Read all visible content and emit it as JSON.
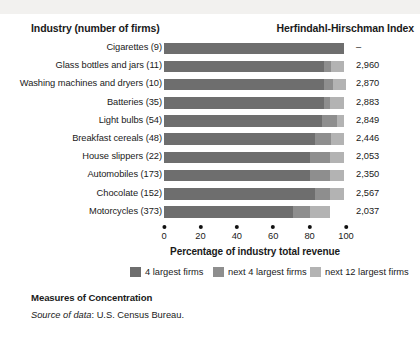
{
  "header": {
    "left_title": "Industry (number of firms)",
    "right_title": "Herfindahl-Hirschman Index"
  },
  "caption": {
    "title": "Measures of Concentration",
    "source_label": "Source of data",
    "source_text": ": U.S. Census Bureau."
  },
  "legend": {
    "items": [
      {
        "label": "4 largest firms",
        "color": "#6e6e6e"
      },
      {
        "label": "next 4 largest firms",
        "color": "#8e8e8e"
      },
      {
        "label": "next 12 largest firms",
        "color": "#b3b3b3"
      }
    ]
  },
  "chart_data": {
    "type": "bar",
    "orientation": "horizontal",
    "stacked": true,
    "title": "Measures of Concentration",
    "xlabel": "Percentage of industry total revenue",
    "ylabel": "Industry (number of firms)",
    "xlim": [
      0,
      100
    ],
    "xticks": [
      0,
      20,
      40,
      60,
      80,
      100
    ],
    "grid": false,
    "legend_position": "bottom",
    "categories": [
      "Cigarettes  (9)",
      "Glass bottles and jars  (11)",
      "Washing machines and dryers  (10)",
      "Batteries  (35)",
      "Light bulbs  (54)",
      "Breakfast cereals  (48)",
      "House slippers  (22)",
      "Automobiles  (173)",
      "Chocolate  (152)",
      "Motorcycles  (373)"
    ],
    "series": [
      {
        "name": "4 largest firms",
        "color": "#6e6e6e",
        "values": [
          99,
          88,
          88,
          88,
          87,
          83,
          80,
          80,
          83,
          71
        ]
      },
      {
        "name": "next 4 largest firms",
        "color": "#8e8e8e",
        "values": [
          0,
          4,
          5,
          3,
          8,
          9,
          11,
          11,
          8,
          9
        ]
      },
      {
        "name": "next 12 largest firms",
        "color": "#b3b3b3",
        "values": [
          0,
          7,
          7,
          8,
          4,
          7,
          8,
          8,
          8,
          11
        ]
      }
    ],
    "value_column_header": "Herfindahl-Hirschman Index",
    "values": [
      "–",
      "2,960",
      "2,870",
      "2,883",
      "2,849",
      "2,446",
      "2,053",
      "2,350",
      "2,567",
      "2,037"
    ]
  }
}
